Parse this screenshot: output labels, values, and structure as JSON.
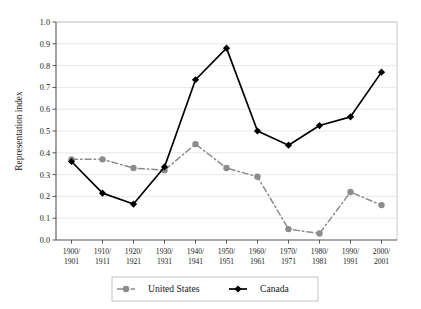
{
  "chart_data": {
    "type": "line",
    "title": "",
    "xlabel": "",
    "ylabel": "Representation index",
    "ylim": [
      0.0,
      1.0
    ],
    "ytick_labels": [
      "0.0",
      "0.1",
      "0.2",
      "0.3",
      "0.4",
      "0.5",
      "0.6",
      "0.7",
      "0.8",
      "0.9",
      "1.0"
    ],
    "ytick_values": [
      0.0,
      0.1,
      0.2,
      0.3,
      0.4,
      0.5,
      0.6,
      0.7,
      0.8,
      0.9,
      1.0
    ],
    "grid": "horizontal",
    "legend_position": "bottom",
    "categories": [
      "1900/\n1901",
      "1910/\n1911",
      "1920/\n1921",
      "1930/\n1931",
      "1940/\n1941",
      "1950/\n1951",
      "1960/\n1961",
      "1970/\n1971",
      "1980/\n1981",
      "1990/\n1991",
      "2000/\n2001"
    ],
    "categories_line1": [
      "1900/",
      "1910/",
      "1920/",
      "1930/",
      "1940/",
      "1950/",
      "1960/",
      "1970/",
      "1980/",
      "1990/",
      "2000/"
    ],
    "categories_line2": [
      "1901",
      "1911",
      "1921",
      "1931",
      "1941",
      "1951",
      "1961",
      "1971",
      "1981",
      "1991",
      "2001"
    ],
    "series": [
      {
        "name": "United States",
        "color": "#8c8c8c",
        "marker": "circle",
        "line_style": "dash-dot",
        "values": [
          0.37,
          0.37,
          0.33,
          0.32,
          0.44,
          0.33,
          0.29,
          0.05,
          0.03,
          0.22,
          0.16
        ]
      },
      {
        "name": "Canada",
        "color": "#000000",
        "marker": "diamond",
        "line_style": "solid",
        "values": [
          0.36,
          0.215,
          0.165,
          0.335,
          0.735,
          0.88,
          0.5,
          0.435,
          0.525,
          0.565,
          0.77
        ]
      }
    ]
  },
  "legend": {
    "items": [
      {
        "label": "United States"
      },
      {
        "label": "Canada"
      }
    ]
  },
  "axes": {
    "y_title": "Representation index"
  }
}
